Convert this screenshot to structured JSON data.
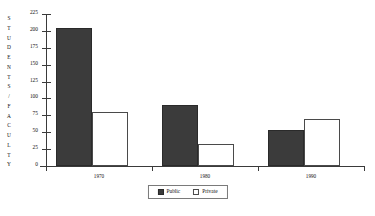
{
  "chart_data": {
    "type": "bar",
    "title": "",
    "xlabel": "",
    "ylabel": "STUDENTS/FACULTY",
    "categories": [
      "1970",
      "1980",
      "1990"
    ],
    "series": [
      {
        "name": "Public",
        "values": [
          205,
          90,
          53
        ],
        "color": "#3b3b3b"
      },
      {
        "name": "Private",
        "values": [
          80,
          33,
          70
        ],
        "color": "#ffffff"
      }
    ],
    "ylim": [
      0,
      225
    ],
    "ytick_step": 25,
    "yticks": [
      0,
      25,
      50,
      75,
      100,
      125,
      150,
      175,
      200,
      225
    ],
    "ytick_labels": [
      "0",
      "25",
      "50",
      "75",
      "100",
      "125",
      "150",
      "175",
      "200",
      "225"
    ],
    "grid": false,
    "legend_position": "bottom-center"
  },
  "legend": {
    "items": [
      {
        "label": "Public",
        "swatch": "filled-dark-square"
      },
      {
        "label": "Private",
        "swatch": "hollow-white-square"
      }
    ]
  },
  "axis": {
    "y_title_letters": [
      "S",
      "T",
      "U",
      "D",
      "E",
      "N",
      "T",
      "S",
      "/",
      "F",
      "A",
      "C",
      "U",
      "L",
      "T",
      "Y"
    ]
  }
}
